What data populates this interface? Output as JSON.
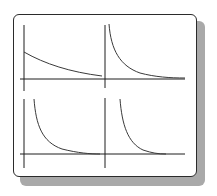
{
  "figure": {
    "colors": {
      "border": "#2b2b2b",
      "shadow": "#a9a9a9",
      "axis": "#1e1e1e",
      "curve": "#3a3a3a",
      "background": "#ffffff"
    }
  },
  "axes": {
    "horizontal": [
      {
        "name": "top-horizontal-axis",
        "x1": 20,
        "y1": 79,
        "x2": 185,
        "y2": 79
      },
      {
        "name": "bottom-horizontal-axis",
        "x1": 20,
        "y1": 154,
        "x2": 185,
        "y2": 154
      }
    ],
    "vertical": [
      {
        "name": "left-upper-vertical-axis",
        "x1": 24,
        "y1": 25,
        "x2": 24,
        "y2": 91
      },
      {
        "name": "left-lower-vertical-axis",
        "x1": 24,
        "y1": 99,
        "x2": 24,
        "y2": 168
      },
      {
        "name": "middle-upper-vertical-axis",
        "x1": 105,
        "y1": 25,
        "x2": 105,
        "y2": 88
      },
      {
        "name": "middle-lower-vertical-axis",
        "x1": 105,
        "y1": 98,
        "x2": 105,
        "y2": 168
      }
    ]
  },
  "curves": [
    {
      "name": "curve-top-left-slow-decay",
      "d": "M24,52 C45,64 70,72 102,76"
    },
    {
      "name": "curve-top-right-decay",
      "d": "M109,24 C111,50 120,66 140,73 C155,77 170,78 185,78"
    },
    {
      "name": "curve-bottom-left-fast-decay",
      "d": "M34,99 C36,125 42,142 62,149 C78,153 90,154 100,154"
    },
    {
      "name": "curve-bottom-right-fast-decay",
      "d": "M120,99 C122,125 128,143 143,150 C152,153 158,154 166,154"
    }
  ]
}
